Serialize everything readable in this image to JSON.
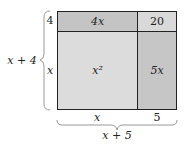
{
  "diagram": {
    "type": "area-model",
    "cells": {
      "top_left": {
        "label": "4x",
        "color": "#c4c4c4"
      },
      "top_right": {
        "label": "20",
        "color": "#d9d9d9"
      },
      "bottom_left": {
        "label": "x²",
        "color": "#dcdcdc"
      },
      "bottom_right": {
        "label": "5x",
        "color": "#c6c6c6"
      }
    },
    "left_labels": {
      "top": "4",
      "bottom": "x",
      "total": "x + 4"
    },
    "bottom_labels": {
      "left": "x",
      "right": "5",
      "total": "x + 5"
    },
    "border_color": "#222222"
  }
}
